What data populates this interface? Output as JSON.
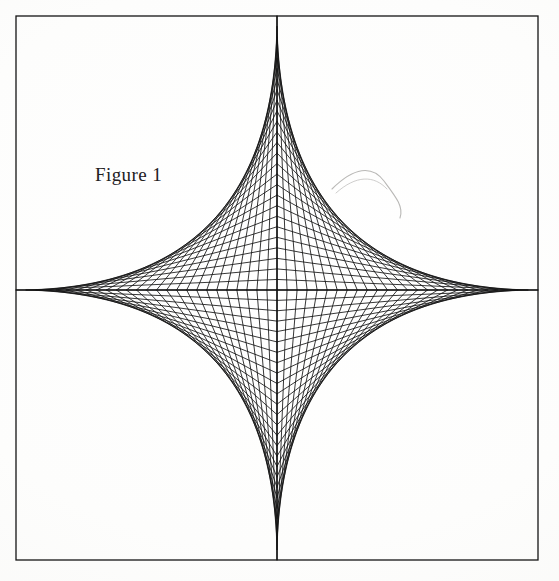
{
  "page": {
    "width": 559,
    "height": 581,
    "background_color": "#fdfdfc",
    "ink_color": "#141414",
    "media": "scanned-paper"
  },
  "figure": {
    "caption": "Figure 1",
    "caption_color": "#22201f",
    "caption_position": {
      "x": 95,
      "y": 165
    },
    "kind": "string-art-envelope",
    "envelope_curve": "astroid"
  },
  "chart_data": {
    "type": "line",
    "title": "Figure 1",
    "xlabel": "",
    "ylabel": "",
    "grid": false,
    "legend": null,
    "frame": {
      "left": 16,
      "top": 16,
      "right": 538,
      "bottom": 560,
      "width": 522,
      "height": 544,
      "stroke": "#141414",
      "stroke_width": 1.3
    },
    "axes": {
      "center_x": 277,
      "center_y": 290,
      "horizontal_axis_y": 290,
      "vertical_axis_x": 277,
      "stroke_width": 1.2
    },
    "cusps": [
      {
        "name": "top",
        "x": 277,
        "y": 16
      },
      {
        "name": "right",
        "x": 538,
        "y": 290
      },
      {
        "name": "bottom",
        "x": 277,
        "y": 560
      },
      {
        "name": "left",
        "x": 16,
        "y": 290
      }
    ],
    "series": [
      {
        "name": "envelope-lines",
        "lines_per_quadrant": 26,
        "quadrants": 4,
        "total_lines": 104,
        "endpoint_spacing_x": 10.04,
        "endpoint_spacing_y": 10.46,
        "stroke": "#141414",
        "stroke_width": 0.85,
        "construction": "segment i joins (cx + sx*(1 - i/n), cy) to (cx, cy + sy*(i/n)) for i = 0..n in each quadrant"
      }
    ],
    "xlim": [
      16,
      538
    ],
    "ylim": [
      16,
      560
    ]
  },
  "artifacts": [
    {
      "name": "scan-hair-fiber",
      "description": "faint curved hair/fiber artifact from the scanner bed",
      "color": "#b9b8b6",
      "bounds": {
        "x": 332,
        "y": 163,
        "width": 80,
        "height": 55
      }
    }
  ]
}
